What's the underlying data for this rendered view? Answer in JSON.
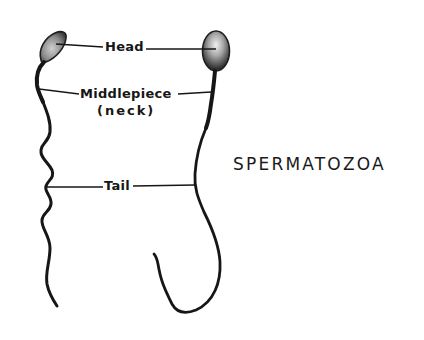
{
  "diagram": {
    "title": "SPERMATOZOA",
    "labels": {
      "head": "Head",
      "middlepiece": "Middlepiece",
      "middlepiece_alt": "(neck)",
      "tail": "Tail"
    },
    "colors": {
      "ink": "#161616",
      "head_fill_light": "#d8d8d8",
      "head_fill_dark": "#5a5a5a",
      "background": "#ffffff"
    }
  }
}
